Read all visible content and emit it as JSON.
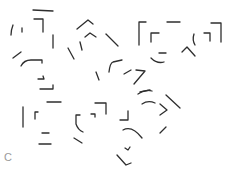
{
  "figure": {
    "panel_label": "C",
    "colors": {
      "background": "#ffffff",
      "stroke": "#2e2e2e",
      "label": "#9a9a9a"
    },
    "stroke_width": 1.3,
    "fragments": [
      {
        "group": "upper-left",
        "d": "M33 10 L53 11"
      },
      {
        "group": "upper-left",
        "d": "M34 19 L43 19 L43 32"
      },
      {
        "group": "upper-left",
        "d": "M53 35 L53 48"
      },
      {
        "group": "upper-left",
        "d": "M13 25 Q11 30 11 35"
      },
      {
        "group": "upper-left",
        "d": "M22 28 L22 32"
      },
      {
        "group": "upper-left",
        "d": "M13 58 L21 52"
      },
      {
        "group": "upper-left",
        "d": "M21 66 Q24 60 31 60 L42 60 L42 63"
      },
      {
        "group": "upper-left",
        "d": "M38 79 L44 79 L43 76"
      },
      {
        "group": "upper-left",
        "d": "M40 89 L53 89 L53 85"
      },
      {
        "group": "upper-middle",
        "d": "M77 29 L88 20 L93 24"
      },
      {
        "group": "upper-middle",
        "d": "M85 37 L90 33 L96 37"
      },
      {
        "group": "upper-middle",
        "d": "M106 34 L118 46"
      },
      {
        "group": "upper-middle",
        "d": "M68 48 L74 59"
      },
      {
        "group": "upper-middle",
        "d": "M80 42 L82 50"
      },
      {
        "group": "upper-middle",
        "d": "M96 72 L99 80"
      },
      {
        "group": "upper-middle",
        "d": "M109 72 Q110 63 113 62 L122 60"
      },
      {
        "group": "upper-middle",
        "d": "M124 74 L131 70"
      },
      {
        "group": "upper-middle",
        "d": "M136 70 L145 71 L134 84"
      },
      {
        "group": "upper-middle",
        "d": "M140 92 L150 90"
      },
      {
        "group": "upper-right",
        "d": "M146 22 L139 22 L139 45"
      },
      {
        "group": "upper-right",
        "d": "M167 22 L180 22"
      },
      {
        "group": "upper-right",
        "d": "M159 33 L151 33 L151 42"
      },
      {
        "group": "upper-right",
        "d": "M159 53 L166 53"
      },
      {
        "group": "upper-right",
        "d": "M151 58 Q157 64 164 62"
      },
      {
        "group": "upper-right",
        "d": "M211 23 L221 23 L221 42"
      },
      {
        "group": "upper-right",
        "d": "M204 33 L210 33 L210 41"
      },
      {
        "group": "upper-right",
        "d": "M194 34 Q192 40 195 45"
      },
      {
        "group": "upper-right",
        "d": "M182 52 L187 47 L195 56"
      },
      {
        "group": "lower-left",
        "d": "M47 102 L61 102"
      },
      {
        "group": "lower-left",
        "d": "M23 107 L23 127"
      },
      {
        "group": "lower-left",
        "d": "M38 112 L35 112 L35 119"
      },
      {
        "group": "lower-left",
        "d": "M42 133 L49 133"
      },
      {
        "group": "lower-left",
        "d": "M39 144 L51 144"
      },
      {
        "group": "lower-middle",
        "d": "M95 103 L106 103 L106 114"
      },
      {
        "group": "lower-middle",
        "d": "M91 114 L95 114 L95 117"
      },
      {
        "group": "lower-middle",
        "d": "M80 115 L76 115 L76 124 Q78 130 83 132"
      },
      {
        "group": "lower-middle",
        "d": "M74 138 L82 143"
      },
      {
        "group": "lower-right",
        "d": "M128 111 L128 120 L120 120"
      },
      {
        "group": "lower-right",
        "d": "M123 130 Q132 125 142 138"
      },
      {
        "group": "lower-right",
        "d": "M125 148 L128 150 L130 147"
      },
      {
        "group": "lower-right",
        "d": "M117 155 L126 165 L131 163"
      },
      {
        "group": "lower-right",
        "d": "M138 94 Q145 89 152 91"
      },
      {
        "group": "lower-right",
        "d": "M142 104 Q148 100 155 103"
      },
      {
        "group": "lower-right",
        "d": "M166 95 L180 108"
      },
      {
        "group": "lower-right",
        "d": "M160 104 L167 110 L160 115"
      },
      {
        "group": "lower-right",
        "d": "M160 133 L166 127"
      }
    ]
  }
}
